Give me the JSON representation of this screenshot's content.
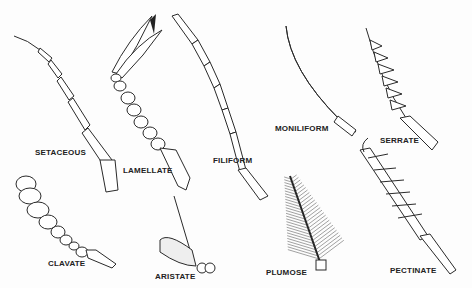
{
  "figure": {
    "labels": {
      "setaceous": "SETACEOUS",
      "lamellate": "LAMELLATE",
      "filiform": "FILIFORM",
      "moniliform": "MONILIFORM",
      "serrate": "SERRATE",
      "clavate": "CLAVATE",
      "aristate": "ARISTATE",
      "plumose": "PLUMOSE",
      "pectinate": "PECTINATE"
    }
  }
}
